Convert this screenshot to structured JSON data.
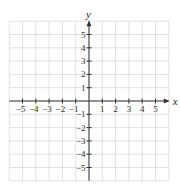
{
  "header": {
    "cropped_text": "· · · · · · · · · · · · · · · · ·"
  },
  "chart_data": {
    "type": "coordinate-grid",
    "title": "",
    "xlabel": "x",
    "ylabel": "y",
    "xlim": [
      -6,
      6
    ],
    "ylim": [
      -6,
      6
    ],
    "grid": true,
    "x_tick_labels": [
      "−5",
      "−4",
      "−3",
      "−2",
      "−1",
      "1",
      "2",
      "3",
      "4",
      "5"
    ],
    "x_tick_values": [
      -5,
      -4,
      -3,
      -2,
      -1,
      1,
      2,
      3,
      4,
      5
    ],
    "y_tick_labels": [
      "5",
      "4",
      "3",
      "2",
      "1",
      "−1",
      "−2",
      "−3",
      "−4",
      "−5"
    ],
    "y_tick_values": [
      5,
      4,
      3,
      2,
      1,
      -1,
      -2,
      -3,
      -4,
      -5
    ],
    "series": []
  },
  "style": {
    "grid_color": "#d9d9d9",
    "axis_color": "#333333",
    "origin_px": [
      89,
      101
    ],
    "unit_px": 13.3
  }
}
